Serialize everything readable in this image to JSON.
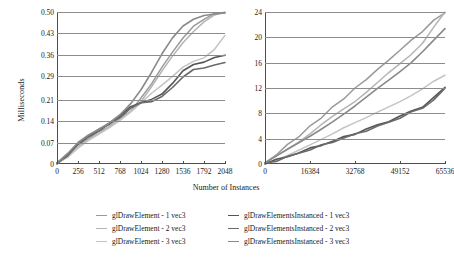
{
  "figure": {
    "xaxis_title": "Number of Instances",
    "yaxis_title": "Milliseconds"
  },
  "chart_data": [
    {
      "type": "line",
      "title": "",
      "panel": "left",
      "xlabel": "Number of Instances",
      "ylabel": "Milliseconds",
      "xlim": [
        0,
        2048
      ],
      "ylim": [
        0,
        0.5
      ],
      "xticks": [
        0,
        256,
        512,
        768,
        1024,
        1280,
        1536,
        1792,
        2048
      ],
      "xtick_labels": [
        "0",
        "256",
        "512",
        "768",
        "1024",
        "1280",
        "1536",
        "1792",
        "2048"
      ],
      "yticks": [
        0,
        0.07,
        0.14,
        0.21,
        0.29,
        0.36,
        0.43,
        0.5
      ],
      "ytick_labels": [
        "0",
        "0.07",
        "0.14",
        "0.21",
        "0.29",
        "0.36",
        "0.43",
        "0.50"
      ],
      "grid": "horizontal",
      "legend_position": "below",
      "x": [
        0,
        128,
        256,
        384,
        512,
        640,
        768,
        896,
        1024,
        1152,
        1280,
        1408,
        1536,
        1664,
        1792,
        1920,
        2048
      ],
      "series": [
        {
          "name": "glDrawElement - 1 vec3",
          "color": "#9a9a9a",
          "width": 1.5,
          "values": [
            0.002,
            0.028,
            0.062,
            0.086,
            0.105,
            0.125,
            0.148,
            0.175,
            0.215,
            0.265,
            0.318,
            0.368,
            0.415,
            0.452,
            0.478,
            0.493,
            0.5
          ]
        },
        {
          "name": "glDrawElement - 2 vec3",
          "color": "#b4b4b4",
          "width": 1.5,
          "values": [
            0.002,
            0.026,
            0.058,
            0.082,
            0.102,
            0.122,
            0.145,
            0.172,
            0.208,
            0.256,
            0.305,
            0.352,
            0.398,
            0.438,
            0.47,
            0.49,
            0.5
          ]
        },
        {
          "name": "glDrawElement - 3 vec3",
          "color": "#c4c4c4",
          "width": 1.5,
          "values": [
            0.002,
            0.024,
            0.055,
            0.08,
            0.1,
            0.12,
            0.142,
            0.168,
            0.198,
            0.23,
            0.258,
            0.288,
            0.32,
            0.34,
            0.352,
            0.38,
            0.425
          ]
        },
        {
          "name": "glDrawElementsInstanced - 1 vec3",
          "color": "#555555",
          "width": 1.6,
          "values": [
            0.002,
            0.03,
            0.066,
            0.092,
            0.112,
            0.133,
            0.158,
            0.186,
            0.204,
            0.212,
            0.228,
            0.268,
            0.305,
            0.326,
            0.338,
            0.348,
            0.358
          ]
        },
        {
          "name": "glDrawElementsInstanced - 2 vec3",
          "color": "#6a6a6a",
          "width": 1.6,
          "values": [
            0.002,
            0.029,
            0.064,
            0.09,
            0.11,
            0.131,
            0.155,
            0.183,
            0.2,
            0.208,
            0.22,
            0.252,
            0.288,
            0.308,
            0.318,
            0.325,
            0.332
          ]
        },
        {
          "name": "glDrawElementsInstanced - 3 vec3",
          "color": "#8a8a8a",
          "width": 1.6,
          "values": [
            0.002,
            0.031,
            0.068,
            0.094,
            0.115,
            0.138,
            0.165,
            0.2,
            0.245,
            0.3,
            0.36,
            0.412,
            0.452,
            0.476,
            0.49,
            0.496,
            0.5
          ]
        }
      ]
    },
    {
      "type": "line",
      "title": "",
      "panel": "right",
      "xlabel": "Number of Instances",
      "ylabel": "Milliseconds",
      "xlim": [
        0,
        65536
      ],
      "ylim": [
        0,
        24
      ],
      "xticks": [
        0,
        16384,
        32768,
        49152,
        65536
      ],
      "xtick_labels": [
        "0",
        "16384",
        "32768",
        "49152",
        "65536"
      ],
      "yticks": [
        0,
        4,
        8,
        12,
        16,
        20,
        24
      ],
      "ytick_labels": [
        "0",
        "4",
        "8",
        "12",
        "16",
        "20",
        "24"
      ],
      "grid": "horizontal",
      "legend_position": "below",
      "x": [
        0,
        4096,
        8192,
        12288,
        16384,
        20480,
        24576,
        28672,
        32768,
        36864,
        40960,
        45056,
        49152,
        53248,
        57344,
        61440,
        65536
      ],
      "series": [
        {
          "name": "glDrawElement - 1 vec3",
          "color": "#9a9a9a",
          "width": 1.5,
          "values": [
            0.1,
            1.5,
            3.0,
            4.4,
            5.9,
            7.4,
            8.9,
            10.4,
            11.9,
            13.4,
            14.9,
            16.4,
            18.0,
            19.5,
            21.0,
            22.6,
            24.0
          ]
        },
        {
          "name": "glDrawElement - 2 vec3",
          "color": "#b4b4b4",
          "width": 1.5,
          "values": [
            0.1,
            1.2,
            2.4,
            3.6,
            4.8,
            6.1,
            7.4,
            8.7,
            10.0,
            11.4,
            12.8,
            14.3,
            15.8,
            17.4,
            19.2,
            21.6,
            24.0
          ]
        },
        {
          "name": "glDrawElement - 3 vec3",
          "color": "#c4c4c4",
          "width": 1.5,
          "values": [
            0.1,
            0.7,
            1.5,
            2.3,
            3.1,
            3.9,
            4.7,
            5.6,
            6.4,
            7.2,
            8.1,
            9.0,
            9.9,
            10.9,
            12.0,
            13.2,
            14.1
          ]
        },
        {
          "name": "glDrawElementsInstanced - 1 vec3",
          "color": "#555555",
          "width": 1.6,
          "values": [
            0.1,
            0.6,
            1.2,
            1.8,
            2.4,
            3.0,
            3.6,
            4.2,
            4.8,
            5.5,
            6.1,
            6.8,
            7.5,
            8.3,
            9.1,
            10.4,
            12.1
          ]
        },
        {
          "name": "glDrawElementsInstanced - 2 vec3",
          "color": "#6a6a6a",
          "width": 1.6,
          "values": [
            0.1,
            0.55,
            1.1,
            1.7,
            2.3,
            2.9,
            3.5,
            4.1,
            4.7,
            5.3,
            5.9,
            6.6,
            7.3,
            8.1,
            8.9,
            10.1,
            11.9
          ]
        },
        {
          "name": "glDrawElementsInstanced - 3 vec3",
          "color": "#8a8a8a",
          "width": 1.6,
          "values": [
            0.1,
            1.1,
            2.2,
            3.3,
            4.4,
            5.6,
            6.8,
            8.0,
            9.2,
            10.5,
            11.8,
            13.1,
            14.5,
            16.0,
            17.8,
            19.7,
            21.5
          ]
        }
      ]
    }
  ],
  "legend": {
    "columns": [
      [
        {
          "label": "glDrawElement - 1 vec3",
          "color": "#9a9a9a",
          "width": 1.5
        },
        {
          "label": "glDrawElement - 2 vec3",
          "color": "#b4b4b4",
          "width": 1.3
        },
        {
          "label": "glDrawElement - 3 vec3",
          "color": "#c4c4c4",
          "width": 1.2
        }
      ],
      [
        {
          "label": "glDrawElementsInstanced - 1 vec3",
          "color": "#555555",
          "width": 1.8
        },
        {
          "label": "glDrawElementsInstanced - 2 vec3",
          "color": "#6a6a6a",
          "width": 1.8
        },
        {
          "label": "glDrawElementsInstanced - 3 vec3",
          "color": "#8a8a8a",
          "width": 1.3
        }
      ]
    ]
  }
}
